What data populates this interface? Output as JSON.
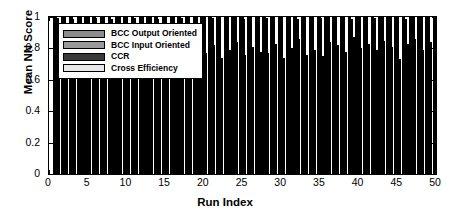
{
  "chart_data": {
    "type": "bar",
    "title": "",
    "subtitle": "",
    "xlabel": "Run Index",
    "ylabel": "Mean NN Score",
    "xlim": [
      0,
      50
    ],
    "ylim": [
      0,
      1
    ],
    "xticks": [
      0,
      5,
      10,
      15,
      20,
      25,
      30,
      35,
      40,
      45,
      50
    ],
    "yticks": [
      0,
      0.2,
      0.4,
      0.6,
      0.8,
      1
    ],
    "xtick_labels": [
      "0",
      "5",
      "10",
      "15",
      "20",
      "25",
      "30",
      "35",
      "40",
      "45",
      "50"
    ],
    "ytick_labels": [
      "0",
      "0.2",
      "0.4",
      "0.6",
      "0.8",
      "1"
    ],
    "grid": false,
    "legend_position": "upper left (inside axes)",
    "grouped": true,
    "categories": [
      1,
      2,
      3,
      4,
      5,
      6,
      7,
      8,
      9,
      10,
      11,
      12,
      13,
      14,
      15,
      16,
      17,
      18,
      19,
      20,
      21,
      22,
      23,
      24,
      25,
      26,
      27,
      28,
      29,
      30,
      31,
      32,
      33,
      34,
      35,
      36,
      37,
      38,
      39,
      40,
      41,
      42,
      43,
      44,
      45,
      46,
      47,
      48,
      49,
      50
    ],
    "series": [
      {
        "name": "BCC Output Oriented",
        "color": "#8c8c8c",
        "values": [
          1,
          1,
          1,
          1,
          1,
          1,
          1,
          1,
          1,
          1,
          1,
          1,
          1,
          1,
          1,
          1,
          1,
          1,
          1,
          1,
          1,
          1,
          1,
          1,
          1,
          1,
          1,
          1,
          1,
          1,
          1,
          1,
          1,
          1,
          1,
          1,
          1,
          1,
          1,
          1,
          1,
          1,
          1,
          1,
          1,
          1,
          1,
          1,
          1,
          1
        ]
      },
      {
        "name": "BCC Input Oriented",
        "color": "#9a9a9a",
        "values": [
          1,
          1,
          1,
          1,
          1,
          1,
          1,
          1,
          1,
          1,
          1,
          1,
          1,
          1,
          1,
          1,
          1,
          1,
          1,
          1,
          1,
          1,
          1,
          1,
          1,
          1,
          1,
          1,
          1,
          1,
          1,
          1,
          1,
          1,
          1,
          1,
          1,
          1,
          1,
          1,
          1,
          1,
          1,
          1,
          1,
          1,
          1,
          1,
          1,
          1
        ]
      },
      {
        "name": "CCR",
        "color": "#3a3a3a",
        "values": [
          0.995,
          1,
          0.99,
          1,
          1,
          0.995,
          1,
          0.99,
          1,
          1,
          0.995,
          1,
          1,
          0.99,
          1,
          1,
          0.995,
          1,
          1,
          1,
          0.995,
          1,
          1,
          1,
          0.99,
          1,
          1,
          0.995,
          1,
          1,
          1,
          0.99,
          1,
          1,
          0.995,
          1,
          1,
          1,
          0.99,
          1,
          1,
          0.995,
          1,
          1,
          1,
          0.99,
          1,
          1,
          1,
          1
        ]
      },
      {
        "name": "Cross Efficiency",
        "color": "#e8e8e8",
        "values": [
          0.7,
          0.7,
          0.7,
          0.7,
          0.7,
          0.7,
          0.7,
          0.7,
          0.7,
          0.7,
          0.7,
          0.7,
          0.7,
          0.7,
          0.7,
          0.78,
          0.76,
          0.79,
          0.75,
          0.77,
          0.82,
          0.74,
          0.79,
          0.84,
          0.76,
          0.81,
          0.78,
          0.77,
          0.83,
          0.74,
          0.8,
          0.86,
          0.76,
          0.79,
          0.75,
          0.84,
          0.82,
          0.78,
          0.87,
          0.8,
          0.83,
          0.79,
          0.85,
          0.81,
          0.73,
          0.83,
          0.86,
          0.79,
          0.84,
          0.82
        ]
      }
    ]
  },
  "axis": {
    "ylabel": "Mean NN Score",
    "xlabel": "Run Index"
  },
  "legend": {
    "items": [
      {
        "label": "BCC Output Oriented",
        "color": "#8c8c8c"
      },
      {
        "label": "BCC Input Oriented",
        "color": "#9a9a9a"
      },
      {
        "label": "CCR",
        "color": "#3a3a3a"
      },
      {
        "label": "Cross Efficiency",
        "color": "#e8e8e8"
      }
    ]
  }
}
